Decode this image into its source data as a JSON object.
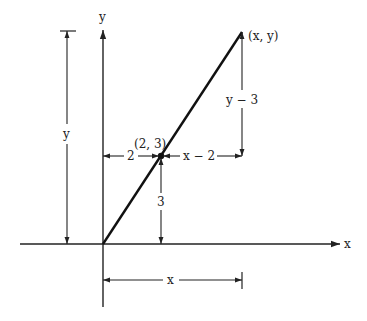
{
  "diagram": {
    "type": "coordinate-geometry",
    "colors": {
      "background": "#ffffff",
      "ink": "#222222"
    },
    "axes": {
      "x_label": "x",
      "y_label": "y"
    },
    "points": {
      "known": {
        "label": "(2, 3)",
        "x": 2,
        "y": 3
      },
      "general": {
        "label": "(x, y)"
      }
    },
    "dimensions": {
      "left_y": "y",
      "bottom_x": "x",
      "small_horizontal": "2",
      "small_vertical": "3",
      "large_horizontal": "x − 2",
      "large_vertical": "y − 3"
    }
  }
}
